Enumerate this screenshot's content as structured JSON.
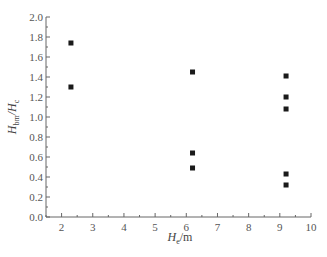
{
  "chart_data": {
    "type": "scatter",
    "title": "",
    "xlabel": "H_e/m",
    "xlabel_main": "H",
    "xlabel_sub": "e",
    "xlabel_unit": "/m",
    "ylabel": "H_bm/H_c",
    "ylabel_main1": "H",
    "ylabel_sub1": "bm",
    "ylabel_main2": "/H",
    "ylabel_sub2": "c",
    "xlim": [
      1.5,
      10
    ],
    "ylim": [
      0.0,
      2.0
    ],
    "x_ticks": [
      "2",
      "3",
      "4",
      "5",
      "6",
      "7",
      "8",
      "9",
      "10"
    ],
    "y_ticks": [
      "0.0",
      "0.2",
      "0.4",
      "0.6",
      "0.8",
      "1.0",
      "1.2",
      "1.4",
      "1.6",
      "1.8",
      "2.0"
    ],
    "grid": false,
    "legend": null,
    "marker": "square",
    "marker_color": "#1a1a1a",
    "series": [
      {
        "name": "data",
        "points": [
          {
            "x": 2.3,
            "y": 1.74
          },
          {
            "x": 2.3,
            "y": 1.3
          },
          {
            "x": 6.2,
            "y": 1.45
          },
          {
            "x": 6.2,
            "y": 0.64
          },
          {
            "x": 6.2,
            "y": 0.49
          },
          {
            "x": 9.2,
            "y": 1.41
          },
          {
            "x": 9.2,
            "y": 1.2
          },
          {
            "x": 9.2,
            "y": 1.08
          },
          {
            "x": 9.2,
            "y": 0.43
          },
          {
            "x": 9.2,
            "y": 0.32
          }
        ]
      }
    ]
  }
}
